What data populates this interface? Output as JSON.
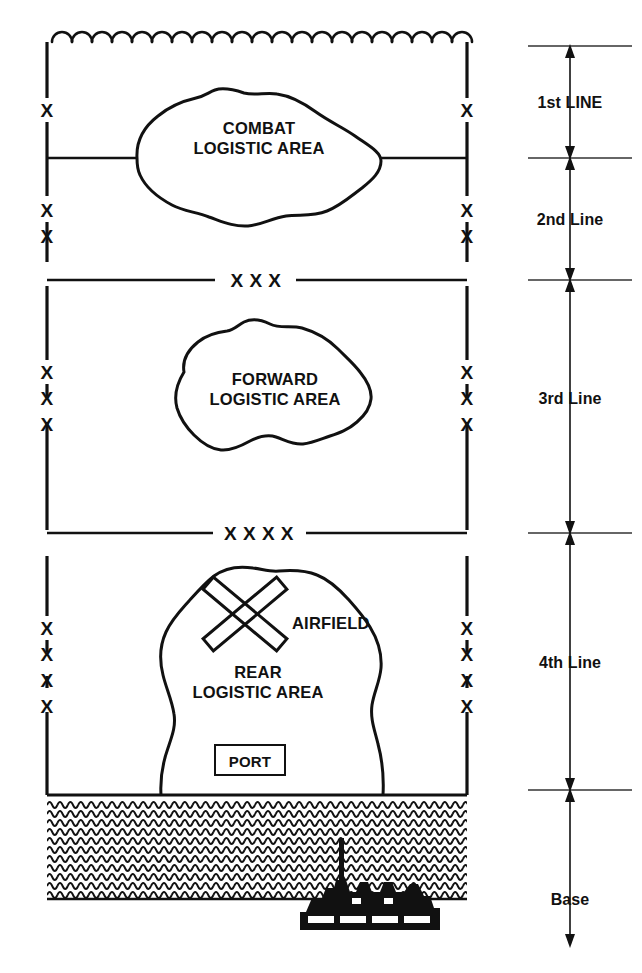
{
  "diagram": {
    "boundary": {
      "left_symbol": "vertical-dashed-boundary",
      "right_symbol": "vertical-dashed-boundary",
      "front_edge_symbol": "scalloped-feba-line"
    },
    "areas": [
      {
        "id": "combat-logistic-area",
        "line1": "COMBAT",
        "line2": "LOGISTIC AREA"
      },
      {
        "id": "forward-logistic-area",
        "line1": "FORWARD",
        "line2": "LOGISTIC AREA"
      },
      {
        "id": "rear-logistic-area",
        "line1": "REAR",
        "line2": "LOGISTIC AREA"
      }
    ],
    "facilities": {
      "airfield_label": "AIRFIELD",
      "airfield_symbol": "crossed-runways-icon",
      "port_label": "PORT",
      "port_symbol": "port-box-icon",
      "ships_symbol": "ships-at-dock-icon",
      "sea_symbol": "wave-hatch-sea"
    },
    "echelon_dividers": [
      {
        "id": "divider-corps",
        "label": "X X X"
      },
      {
        "id": "divider-army",
        "label": "X X X X"
      }
    ],
    "boundary_x_marks": {
      "symbol": "x-boundary-mark",
      "glyph": "X",
      "left_groups": [
        {
          "at": "between-feba-and-brigade",
          "count": 1
        },
        {
          "at": "below-brigade-rear",
          "count": 1
        },
        {
          "at": "above-corps-divider",
          "count": 1
        },
        {
          "at": "division-area-upper",
          "count": 1
        },
        {
          "at": "division-area-mid",
          "count": 1
        },
        {
          "at": "division-area-lower",
          "count": 1
        },
        {
          "at": "rear-area-1",
          "count": 1
        },
        {
          "at": "rear-area-2",
          "count": 1
        },
        {
          "at": "rear-area-3",
          "count": 1
        },
        {
          "at": "rear-area-4",
          "count": 1
        }
      ]
    },
    "scale": {
      "name": "lines-of-support-scale",
      "segments": [
        {
          "id": "scale-1st-line",
          "label": "1st LINE"
        },
        {
          "id": "scale-2nd-line",
          "label": "2nd Line"
        },
        {
          "id": "scale-3rd-line",
          "label": "3rd Line"
        },
        {
          "id": "scale-4th-line",
          "label": "4th Line"
        },
        {
          "id": "scale-base",
          "label": "Base"
        }
      ],
      "tick_symbol": "scale-tick-rule",
      "arrow_symbol": "double-headed-arrow"
    },
    "colors": {
      "ink": "#111111",
      "rule": "#333333",
      "background": "#ffffff"
    }
  }
}
